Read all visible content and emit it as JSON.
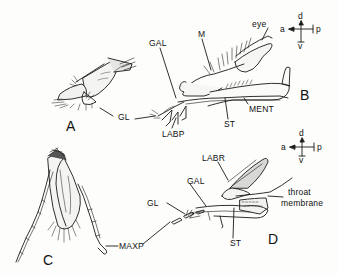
{
  "figure": {
    "panels": [
      {
        "id": "A",
        "label": "A"
      },
      {
        "id": "B",
        "label": "B"
      },
      {
        "id": "C",
        "label": "C"
      },
      {
        "id": "D",
        "label": "D"
      }
    ],
    "labels": {
      "gl_a": "GL",
      "gal_b": "GAL",
      "m_b": "M",
      "eye_b": "eye",
      "labp_b": "LABP",
      "st_b": "ST",
      "ment_b": "MENT",
      "labr_d": "LABR",
      "gal_d": "GAL",
      "gl_d": "GL",
      "throat_d_1": "throat",
      "throat_d_2": "membrane",
      "st_d": "ST",
      "maxp_c": "MAXP"
    },
    "orientation_top": {
      "dorsal": "d",
      "ventral": "v",
      "anterior": "a",
      "posterior": "p"
    },
    "orientation_bottom": {
      "dorsal": "d",
      "ventral": "v",
      "anterior": "a",
      "posterior": "p"
    }
  }
}
